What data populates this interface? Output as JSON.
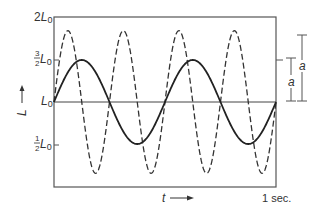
{
  "figure": {
    "y_axis": {
      "label": "L",
      "ticks": [
        {
          "id": "two",
          "coef": "2",
          "sym": "L",
          "sub": "0",
          "value": 2.0
        },
        {
          "id": "three_halves",
          "num": "3",
          "den": "2",
          "sym": "L",
          "sub": "0",
          "value": 1.5
        },
        {
          "id": "one",
          "coef": "",
          "sym": "L",
          "sub": "0",
          "value": 1.0
        },
        {
          "id": "half",
          "num": "1",
          "den": "2",
          "sym": "L",
          "sub": "0",
          "value": 0.5
        }
      ]
    },
    "x_axis": {
      "label": "t",
      "end_label": "1 sec."
    },
    "amplitude_markers": [
      {
        "label": "a",
        "from": 1.0,
        "to": 1.5
      },
      {
        "label": "a",
        "from": 1.0,
        "to": 1.85
      }
    ],
    "curves": [
      {
        "name": "solid",
        "style": "solid",
        "baseline": "L0",
        "amplitude_rel": 0.5,
        "cycles": 2
      },
      {
        "name": "dashed",
        "style": "dashed",
        "baseline": "L0",
        "amplitude_rel": 0.85,
        "cycles": 4
      }
    ],
    "colors": {
      "ink": "#333333",
      "frame": "#555555",
      "background": "#ffffff"
    }
  }
}
